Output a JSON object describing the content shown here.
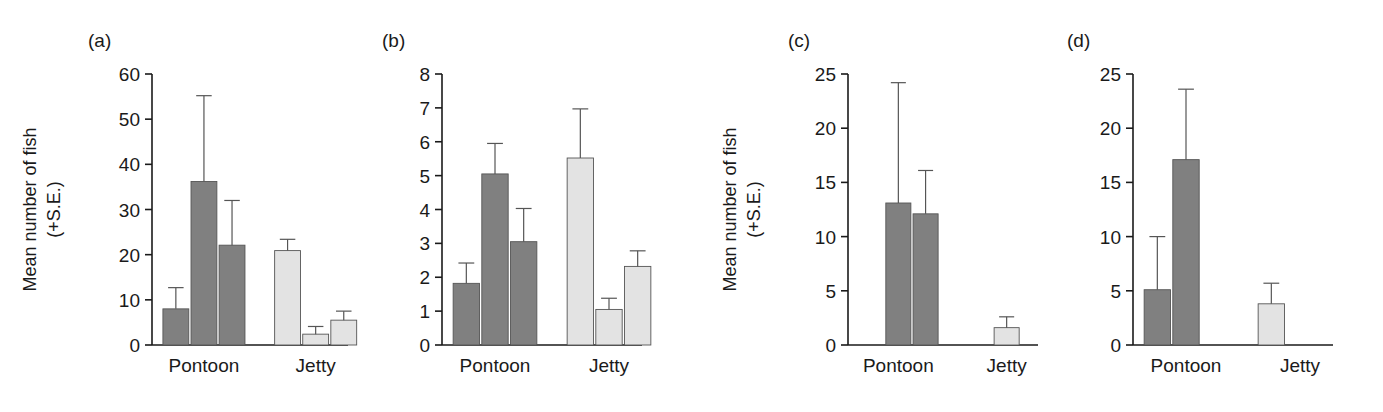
{
  "figure": {
    "background": "#ffffff",
    "bar_dark_color": "#808080",
    "bar_light_color": "#e3e3e3",
    "bar_edge_color": "#555555",
    "axis_color": "#1a1a1a",
    "error_bar_color": "#555555",
    "axis_title_line1": "Mean number of fish",
    "axis_title_line2": "(+S.E.)"
  },
  "chart_data": [
    {
      "type": "bar",
      "panel": "(a)",
      "title": "",
      "xlabel": "",
      "ylabel": "Mean number of fish (+S.E.)",
      "ylim": [
        0,
        60
      ],
      "yticks": [
        0,
        10,
        20,
        30,
        40,
        50,
        60
      ],
      "ytick_labels": [
        "0",
        "10",
        "20",
        "30",
        "40",
        "50",
        "60"
      ],
      "grid": false,
      "legend": "none",
      "categories": [
        "Pontoon",
        "Jetty"
      ],
      "groups": [
        {
          "category": "Pontoon",
          "shade": "dark",
          "slots": [
            1,
            2,
            3
          ],
          "values": [
            8.0,
            36.2,
            22.1
          ],
          "errors": [
            4.7,
            19.0,
            9.9
          ],
          "error_tops": [
            12.7,
            55.2,
            32.0
          ]
        },
        {
          "category": "Jetty",
          "shade": "light",
          "slots": [
            1,
            2,
            3
          ],
          "values": [
            20.9,
            2.4,
            5.5
          ],
          "errors": [
            2.5,
            1.7,
            2.0
          ],
          "error_tops": [
            23.4,
            4.1,
            7.5
          ]
        }
      ]
    },
    {
      "type": "bar",
      "panel": "(b)",
      "title": "",
      "xlabel": "",
      "ylabel": "",
      "ylim": [
        0,
        8
      ],
      "yticks": [
        0,
        1,
        2,
        3,
        4,
        5,
        6,
        7,
        8
      ],
      "ytick_labels": [
        "0",
        "1",
        "2",
        "3",
        "4",
        "5",
        "6",
        "7",
        "8"
      ],
      "grid": false,
      "legend": "none",
      "categories": [
        "Pontoon",
        "Jetty"
      ],
      "groups": [
        {
          "category": "Pontoon",
          "shade": "dark",
          "slots": [
            1,
            2,
            3
          ],
          "values": [
            1.82,
            5.05,
            3.05
          ],
          "errors": [
            0.6,
            0.9,
            0.98
          ],
          "error_tops": [
            2.42,
            5.95,
            4.03
          ]
        },
        {
          "category": "Jetty",
          "shade": "light",
          "slots": [
            1,
            2,
            3
          ],
          "values": [
            5.52,
            1.05,
            2.32
          ],
          "errors": [
            1.45,
            0.33,
            0.46
          ],
          "error_tops": [
            6.97,
            1.38,
            2.78
          ]
        }
      ]
    },
    {
      "type": "bar",
      "panel": "(c)",
      "title": "",
      "xlabel": "",
      "ylabel": "Mean number of fish (+S.E.)",
      "ylim": [
        0,
        25
      ],
      "yticks": [
        0,
        5,
        10,
        15,
        20,
        25
      ],
      "ytick_labels": [
        "0",
        "5",
        "10",
        "15",
        "20",
        "25"
      ],
      "grid": false,
      "legend": "none",
      "categories": [
        "Pontoon",
        "Jetty"
      ],
      "groups": [
        {
          "category": "Pontoon",
          "shade": "dark",
          "slots": [
            2,
            3
          ],
          "values": [
            13.1,
            12.1
          ],
          "errors": [
            11.1,
            4.0
          ],
          "error_tops": [
            24.2,
            16.1
          ]
        },
        {
          "category": "Jetty",
          "shade": "light",
          "slots": [
            2
          ],
          "values": [
            1.6
          ],
          "errors": [
            1.0
          ],
          "error_tops": [
            2.6
          ]
        }
      ]
    },
    {
      "type": "bar",
      "panel": "(d)",
      "title": "",
      "xlabel": "",
      "ylabel": "",
      "ylim": [
        0,
        25
      ],
      "yticks": [
        0,
        5,
        10,
        15,
        20,
        25
      ],
      "ytick_labels": [
        "0",
        "5",
        "10",
        "15",
        "20",
        "25"
      ],
      "grid": false,
      "legend": "none",
      "categories": [
        "Pontoon",
        "Jetty"
      ],
      "groups": [
        {
          "category": "Pontoon",
          "shade": "dark",
          "slots": [
            1,
            2
          ],
          "values": [
            5.1,
            17.1
          ],
          "errors": [
            4.9,
            6.5
          ],
          "error_tops": [
            10.0,
            23.6
          ]
        },
        {
          "category": "Jetty",
          "shade": "light",
          "slots": [
            1
          ],
          "values": [
            3.8
          ],
          "errors": [
            1.9
          ],
          "error_tops": [
            5.7
          ]
        }
      ]
    }
  ],
  "layout": {
    "panels": [
      {
        "key": "a",
        "left": 0,
        "width": 370,
        "has_ylabel": true,
        "plot_left": 152,
        "plot_width": 196
      },
      {
        "key": "b",
        "left": 370,
        "width": 300,
        "has_ylabel": false,
        "plot_left": 72,
        "plot_width": 200
      },
      {
        "key": "c",
        "left": 700,
        "width": 355,
        "has_ylabel": true,
        "plot_left": 148,
        "plot_width": 190
      },
      {
        "key": "d",
        "left": 1055,
        "width": 328,
        "has_ylabel": false,
        "plot_left": 78,
        "plot_width": 200
      }
    ],
    "plot_top": 74,
    "plot_bottom": 345,
    "cat_label_y": 372,
    "panel_letter_y": 47
  }
}
